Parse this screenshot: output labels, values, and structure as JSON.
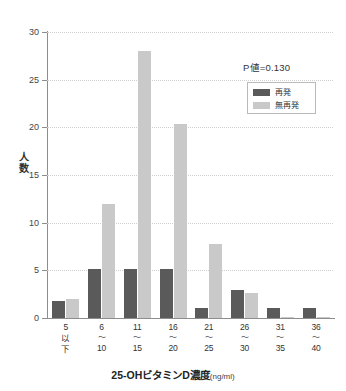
{
  "chart_data": {
    "type": "bar",
    "title": "",
    "xlabel": "25-OHビタミンD濃度(ng/ml)",
    "xlabel_main": "25-OHビタミンD濃度",
    "xlabel_unit": "(ng/ml)",
    "ylabel": "人数",
    "ylabel_chars": [
      "人",
      "数"
    ],
    "ylim": [
      0,
      30
    ],
    "yticks": [
      0,
      5,
      10,
      15,
      20,
      25,
      30
    ],
    "ytick_labels": [
      "0",
      "5",
      "10",
      "15",
      "20",
      "25",
      "30"
    ],
    "grid": true,
    "legend_position": "upper-right",
    "categories": [
      "5以下",
      "6〜10",
      "11〜15",
      "16〜20",
      "21〜25",
      "26〜30",
      "31〜35",
      "36〜40"
    ],
    "category_lines": [
      [
        "5",
        "以",
        "下"
      ],
      [
        "6",
        "〜",
        "10"
      ],
      [
        "11",
        "〜",
        "15"
      ],
      [
        "16",
        "〜",
        "20"
      ],
      [
        "21",
        "〜",
        "25"
      ],
      [
        "26",
        "〜",
        "30"
      ],
      [
        "31",
        "〜",
        "35"
      ],
      [
        "36",
        "〜",
        "40"
      ]
    ],
    "series": [
      {
        "name": "再発",
        "color": "#5a5a5a",
        "values": [
          1.8,
          5.1,
          5.1,
          5.1,
          1.1,
          2.9,
          1.1,
          1.1
        ]
      },
      {
        "name": "無再発",
        "color": "#c9c9c9",
        "values": [
          2.0,
          12.0,
          28.0,
          20.3,
          7.8,
          2.6,
          0.15,
          0.15
        ]
      }
    ],
    "annotations": [
      {
        "name": "p-value",
        "text": "P値=0.130"
      }
    ]
  },
  "legend": {
    "items": [
      {
        "label": "再発",
        "color": "#5a5a5a"
      },
      {
        "label": "無再発",
        "color": "#c9c9c9"
      }
    ]
  },
  "colors": {
    "series_dark": "#5a5a5a",
    "series_light": "#c9c9c9",
    "axis": "#8d8d8d",
    "grid": "#cfcfcf",
    "text": "#333333",
    "background": "#ffffff"
  }
}
